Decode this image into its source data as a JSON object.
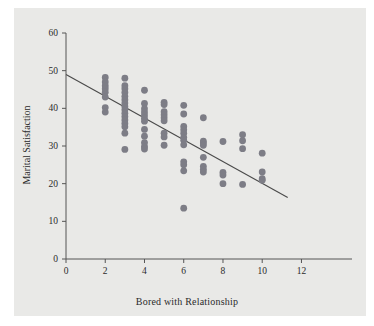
{
  "figure": {
    "panel_color": "#e9e9e7",
    "page_color": "#ffffff",
    "axis_color": "#555555",
    "point_color": "#7d7d86",
    "line_color": "#4a4a4a",
    "text_color": "#2b2b2b"
  },
  "chart_data": {
    "type": "scatter",
    "title": "",
    "xlabel": "Bored with Relationship",
    "ylabel": "Marital Satisfaction",
    "xlim": [
      0,
      13.2
    ],
    "ylim": [
      0,
      60
    ],
    "xticks": [
      0,
      2,
      4,
      6,
      8,
      10,
      12
    ],
    "xtick_labels": [
      "0",
      "2",
      "4",
      "6",
      "8",
      "10",
      "12"
    ],
    "yticks": [
      0,
      10,
      20,
      30,
      40,
      50,
      60
    ],
    "ytick_labels": [
      "0",
      "10",
      "20",
      "30",
      "40",
      "50",
      "60"
    ],
    "grid": false,
    "legend": null,
    "marker": "circle",
    "marker_size": 3.4,
    "points": [
      [
        2,
        48.2
      ],
      [
        2,
        47.0
      ],
      [
        2,
        46.0
      ],
      [
        2,
        45.2
      ],
      [
        2,
        44.3
      ],
      [
        2,
        43.0
      ],
      [
        2,
        40.2
      ],
      [
        2,
        39.0
      ],
      [
        3,
        48.0
      ],
      [
        3,
        46.0
      ],
      [
        3,
        45.2
      ],
      [
        3,
        44.2
      ],
      [
        3,
        43.2
      ],
      [
        3,
        42.3
      ],
      [
        3,
        41.4
      ],
      [
        3,
        40.5
      ],
      [
        3,
        39.6
      ],
      [
        3,
        38.7
      ],
      [
        3,
        37.8
      ],
      [
        3,
        36.9
      ],
      [
        3,
        36.0
      ],
      [
        3,
        35.1
      ],
      [
        3,
        33.4
      ],
      [
        3,
        29.1
      ],
      [
        4,
        44.8
      ],
      [
        4,
        41.3
      ],
      [
        4,
        39.9
      ],
      [
        4,
        39.0
      ],
      [
        4,
        38.2
      ],
      [
        4,
        37.4
      ],
      [
        4,
        36.6
      ],
      [
        4,
        34.4
      ],
      [
        4,
        32.6
      ],
      [
        4,
        30.9
      ],
      [
        4,
        29.9
      ],
      [
        4,
        29.2
      ],
      [
        5,
        41.6
      ],
      [
        5,
        41.0
      ],
      [
        5,
        39.1
      ],
      [
        5,
        38.3
      ],
      [
        5,
        37.5
      ],
      [
        5,
        36.7
      ],
      [
        5,
        33.4
      ],
      [
        5,
        32.4
      ],
      [
        5,
        30.2
      ],
      [
        6,
        40.8
      ],
      [
        6,
        38.5
      ],
      [
        6,
        35.2
      ],
      [
        6,
        34.3
      ],
      [
        6,
        33.4
      ],
      [
        6,
        32.3
      ],
      [
        6,
        31.5
      ],
      [
        6,
        30.3
      ],
      [
        6,
        25.8
      ],
      [
        6,
        25.0
      ],
      [
        6,
        23.4
      ],
      [
        6,
        13.5
      ],
      [
        7,
        37.5
      ],
      [
        7,
        31.3
      ],
      [
        7,
        30.8
      ],
      [
        7,
        30.2
      ],
      [
        7,
        27.0
      ],
      [
        7,
        24.6
      ],
      [
        7,
        23.8
      ],
      [
        7,
        23.1
      ],
      [
        8,
        31.2
      ],
      [
        8,
        23.0
      ],
      [
        8,
        22.3
      ],
      [
        8,
        20.0
      ],
      [
        9,
        33.0
      ],
      [
        9,
        31.4
      ],
      [
        9,
        29.3
      ],
      [
        9,
        19.8
      ],
      [
        10,
        28.1
      ],
      [
        10,
        23.1
      ],
      [
        10,
        21.3
      ],
      [
        10,
        20.9
      ]
    ],
    "trendline": {
      "type": "linear",
      "x_start": 0.0,
      "y_start": 49.0,
      "x_end": 11.3,
      "y_end": 16.3,
      "slope": -2.894,
      "intercept": 49.0
    }
  }
}
